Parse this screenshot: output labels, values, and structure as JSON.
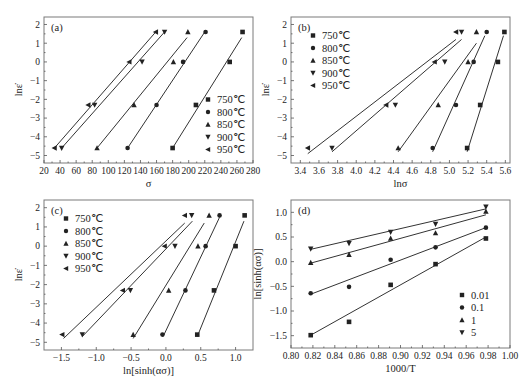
{
  "chart_data": [
    {
      "panel": "(a)",
      "type": "scatter",
      "title": "",
      "xlabel": "σ",
      "ylabel": "lnε̇",
      "xlim": [
        20,
        280
      ],
      "ylim": [
        -5.4,
        2.4
      ],
      "xticks": [
        20,
        40,
        60,
        80,
        100,
        120,
        140,
        160,
        180,
        200,
        220,
        240,
        260,
        280
      ],
      "yticks": [
        -5,
        -4,
        -3,
        -2,
        -1,
        0,
        1,
        2
      ],
      "grid": false,
      "legend_position": "lower right",
      "series": [
        {
          "name": "750℃",
          "marker": "square",
          "x": [
            180,
            209,
            251,
            267
          ],
          "y": [
            -4.6,
            -2.3,
            0,
            1.6
          ],
          "fit": [
            [
              180,
              -4.6
            ],
            [
              266,
              1.3
            ]
          ]
        },
        {
          "name": "800℃",
          "marker": "circle",
          "x": [
            124,
            160,
            193,
            221
          ],
          "y": [
            -4.6,
            -2.3,
            0,
            1.6
          ],
          "fit": [
            [
              124,
              -4.6
            ],
            [
              220,
              1.6
            ]
          ]
        },
        {
          "name": "850℃",
          "marker": "triangle-up",
          "x": [
            86,
            132,
            181,
            199
          ],
          "y": [
            -4.6,
            -2.3,
            0,
            1.6
          ],
          "fit": [
            [
              86,
              -4.6
            ],
            [
              198,
              1.3
            ]
          ]
        },
        {
          "name": "900℃",
          "marker": "triangle-down",
          "x": [
            42,
            83,
            142,
            170
          ],
          "y": [
            -4.6,
            -2.3,
            0,
            1.6
          ],
          "fit": [
            [
              42,
              -4.6
            ],
            [
              170,
              1.6
            ]
          ]
        },
        {
          "name": "950℃",
          "marker": "triangle-left",
          "x": [
            33,
            75,
            126,
            159
          ],
          "y": [
            -4.6,
            -2.3,
            0,
            1.6
          ],
          "fit": [
            [
              33,
              -4.6
            ],
            [
              159,
              1.6
            ]
          ]
        }
      ]
    },
    {
      "panel": "(b)",
      "type": "scatter",
      "title": "",
      "xlabel": "lnσ",
      "ylabel": "lnε̇",
      "xlim": [
        3.3,
        5.65
      ],
      "ylim": [
        -5.4,
        2.4
      ],
      "xticks": [
        3.4,
        3.6,
        3.8,
        4.0,
        4.2,
        4.4,
        4.6,
        4.8,
        5.0,
        5.2,
        5.4,
        5.6
      ],
      "yticks": [
        -5,
        -4,
        -3,
        -2,
        -1,
        0,
        1,
        2
      ],
      "grid": false,
      "legend_position": "upper left",
      "series": [
        {
          "name": "750℃",
          "marker": "square",
          "x": [
            5.19,
            5.33,
            5.52,
            5.59
          ],
          "y": [
            -4.6,
            -2.3,
            0,
            1.6
          ],
          "fit": [
            [
              5.19,
              -4.8
            ],
            [
              5.58,
              1.4
            ]
          ]
        },
        {
          "name": "800℃",
          "marker": "circle",
          "x": [
            4.82,
            5.07,
            5.26,
            5.4
          ],
          "y": [
            -4.6,
            -2.3,
            0,
            1.6
          ],
          "fit": [
            [
              4.82,
              -4.8
            ],
            [
              5.38,
              1.4
            ]
          ]
        },
        {
          "name": "850℃",
          "marker": "triangle-up",
          "x": [
            4.45,
            4.88,
            5.2,
            5.29
          ],
          "y": [
            -4.6,
            -2.3,
            0,
            1.6
          ],
          "fit": [
            [
              4.45,
              -4.8
            ],
            [
              5.29,
              1.0
            ]
          ]
        },
        {
          "name": "900℃",
          "marker": "triangle-down",
          "x": [
            3.74,
            4.42,
            4.95,
            5.13
          ],
          "y": [
            -4.6,
            -2.3,
            0,
            1.6
          ],
          "fit": [
            [
              3.74,
              -4.8
            ],
            [
              5.13,
              1.2
            ]
          ]
        },
        {
          "name": "950℃",
          "marker": "triangle-left",
          "x": [
            3.48,
            4.32,
            4.84,
            5.07
          ],
          "y": [
            -4.6,
            -2.3,
            0,
            1.6
          ],
          "fit": [
            [
              3.48,
              -4.9
            ],
            [
              5.07,
              1.2
            ]
          ]
        }
      ]
    },
    {
      "panel": "(c)",
      "type": "scatter",
      "title": "",
      "xlabel": "ln[sinh(ασ)]",
      "ylabel": "lnε̇",
      "xlim": [
        -1.75,
        1.25
      ],
      "ylim": [
        -5.4,
        2.4
      ],
      "xticks": [
        -1.5,
        -1.0,
        -0.5,
        0.0,
        0.5,
        1.0
      ],
      "yticks": [
        -5,
        -4,
        -3,
        -2,
        -1,
        0,
        1,
        2
      ],
      "grid": false,
      "legend_position": "upper left",
      "series": [
        {
          "name": "750℃",
          "marker": "square",
          "x": [
            0.45,
            0.69,
            1.0,
            1.13
          ],
          "y": [
            -4.6,
            -2.3,
            0,
            1.6
          ],
          "fit": [
            [
              0.45,
              -4.7
            ],
            [
              1.12,
              1.3
            ]
          ]
        },
        {
          "name": "800℃",
          "marker": "circle",
          "x": [
            -0.05,
            0.28,
            0.57,
            0.77
          ],
          "y": [
            -4.6,
            -2.3,
            0,
            1.6
          ],
          "fit": [
            [
              -0.04,
              -4.7
            ],
            [
              0.77,
              1.5
            ]
          ]
        },
        {
          "name": "850℃",
          "marker": "triangle-up",
          "x": [
            -0.47,
            0.04,
            0.46,
            0.62
          ],
          "y": [
            -4.6,
            -2.3,
            0,
            1.6
          ],
          "fit": [
            [
              -0.47,
              -4.8
            ],
            [
              0.55,
              1.2
            ]
          ]
        },
        {
          "name": "900℃",
          "marker": "triangle-down",
          "x": [
            -1.2,
            -0.51,
            0.13,
            0.37
          ],
          "y": [
            -4.6,
            -2.3,
            0,
            1.6
          ],
          "fit": [
            [
              -1.2,
              -4.7
            ],
            [
              0.38,
              1.3
            ]
          ]
        },
        {
          "name": "950℃",
          "marker": "triangle-left",
          "x": [
            -1.49,
            -0.62,
            -0.02,
            0.27
          ],
          "y": [
            -4.6,
            -2.3,
            0,
            1.6
          ],
          "fit": [
            [
              -1.47,
              -4.8
            ],
            [
              0.27,
              1.2
            ]
          ]
        }
      ]
    },
    {
      "panel": "(d)",
      "type": "scatter",
      "title": "",
      "xlabel": "1000/T",
      "ylabel": "ln[sinh(ασ)]",
      "xlim": [
        0.8,
        1.0
      ],
      "ylim": [
        -1.75,
        1.25
      ],
      "xticks": [
        0.8,
        0.82,
        0.84,
        0.86,
        0.88,
        0.9,
        0.92,
        0.94,
        0.96,
        0.98,
        1.0
      ],
      "yticks": [
        -1.5,
        -1.0,
        -0.5,
        0.0,
        0.5,
        1.0
      ],
      "grid": false,
      "legend_position": "lower right",
      "series": [
        {
          "name": "0.01",
          "marker": "square",
          "x": [
            0.818,
            0.853,
            0.891,
            0.932,
            0.978
          ],
          "y": [
            -1.49,
            -1.22,
            -0.47,
            -0.05,
            0.47
          ],
          "fit": [
            [
              0.818,
              -1.49
            ],
            [
              0.978,
              0.5
            ]
          ]
        },
        {
          "name": "0.1",
          "marker": "circle",
          "x": [
            0.818,
            0.853,
            0.891,
            0.932,
            0.978
          ],
          "y": [
            -0.64,
            -0.51,
            0.04,
            0.29,
            0.69
          ],
          "fit": [
            [
              0.818,
              -0.66
            ],
            [
              0.978,
              0.69
            ]
          ]
        },
        {
          "name": "1",
          "marker": "triangle-up",
          "x": [
            0.818,
            0.853,
            0.891,
            0.932,
            0.978
          ],
          "y": [
            -0.02,
            0.14,
            0.47,
            0.58,
            1.02
          ],
          "fit": [
            [
              0.818,
              -0.03
            ],
            [
              0.978,
              0.95
            ]
          ]
        },
        {
          "name": "5",
          "marker": "triangle-down",
          "x": [
            0.818,
            0.853,
            0.891,
            0.932,
            0.978
          ],
          "y": [
            0.26,
            0.37,
            0.6,
            0.76,
            1.11
          ],
          "fit": [
            [
              0.818,
              0.25
            ],
            [
              0.978,
              1.07
            ]
          ]
        }
      ]
    }
  ],
  "layout": {
    "panels": [
      {
        "frame": [
          44,
          17,
          253,
          163
        ]
      },
      {
        "frame": [
          291,
          17,
          510,
          163
        ]
      },
      {
        "frame": [
          44,
          200,
          253,
          350
        ]
      },
      {
        "frame": [
          291,
          200,
          510,
          348
        ]
      }
    ]
  }
}
